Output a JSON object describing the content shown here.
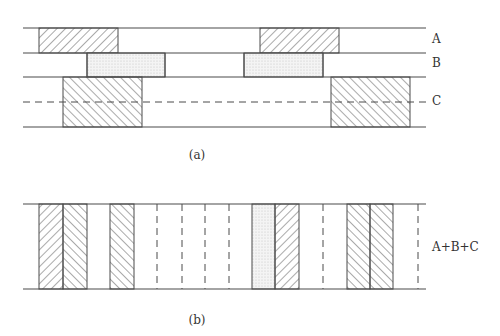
{
  "colors": {
    "line": "#4a4a4a",
    "hatch": "#555555",
    "stipple": "#bdbdbd",
    "background": "#ffffff"
  },
  "panel_a": {
    "caption": "(a)",
    "x_start": 23,
    "x_end": 426,
    "rows": [
      {
        "label": "A",
        "top": 28,
        "bottom": 53,
        "fill": "hatch-forward",
        "blocks": [
          [
            39,
            118
          ],
          [
            260,
            339
          ]
        ],
        "dividers": []
      },
      {
        "label": "B",
        "top": 53,
        "bottom": 77,
        "fill": "stipple",
        "blocks": [
          [
            87,
            165
          ],
          [
            244,
            323
          ]
        ],
        "dividers": [
          87,
          165,
          244,
          323
        ]
      },
      {
        "label": "C",
        "top": 77,
        "bottom": 127,
        "fill": "hatch-back",
        "blocks": [
          [
            63,
            142
          ],
          [
            331,
            410
          ]
        ],
        "dividers": [],
        "dashed_midline": 102
      }
    ],
    "labels": [
      {
        "text": "A",
        "x": 432,
        "y": 33
      },
      {
        "text": "B",
        "x": 432,
        "y": 57
      },
      {
        "text": "C",
        "x": 432,
        "y": 95
      }
    ],
    "caption_pos": {
      "x": 197,
      "y": 149
    }
  },
  "panel_b": {
    "caption": "(b)",
    "label": "A+B+C",
    "label_pos": {
      "x": 432,
      "y": 241
    },
    "top": 204,
    "bottom": 289,
    "x_start": 23,
    "x_end": 426,
    "stripes": [
      {
        "x0": 39,
        "x1": 63,
        "fill": "hatch-forward"
      },
      {
        "x0": 63,
        "x1": 87,
        "fill": "hatch-back"
      },
      {
        "x0": 110,
        "x1": 134,
        "fill": "hatch-back"
      },
      {
        "x0": 252,
        "x1": 275,
        "fill": "stipple"
      },
      {
        "x0": 275,
        "x1": 299,
        "fill": "hatch-forward"
      },
      {
        "x0": 347,
        "x1": 370,
        "fill": "hatch-back"
      },
      {
        "x0": 370,
        "x1": 393,
        "fill": "hatch-back"
      }
    ],
    "dashed_lines": [
      157,
      182,
      205,
      229,
      323,
      418
    ],
    "caption_pos": {
      "x": 197,
      "y": 314
    }
  }
}
